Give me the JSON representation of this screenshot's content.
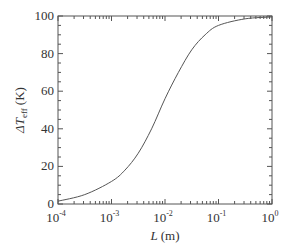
{
  "chart_data": {
    "type": "line",
    "title": "",
    "xlabel": "L (m)",
    "xlabel_var": "L",
    "xlabel_unit": "(m)",
    "ylabel": "ΔT_eff (K)",
    "ylabel_prefix": "ΔT",
    "ylabel_sub": "eff",
    "ylabel_unit": "(K)",
    "xscale": "log",
    "xlim": [
      0.0001,
      1
    ],
    "ylim": [
      0,
      100
    ],
    "grid": false,
    "legend": null,
    "x_ticks": [
      {
        "base": "10",
        "exp": "-4",
        "value": 0.0001
      },
      {
        "base": "10",
        "exp": "-3",
        "value": 0.001
      },
      {
        "base": "10",
        "exp": "-2",
        "value": 0.01
      },
      {
        "base": "10",
        "exp": "-1",
        "value": 0.1
      },
      {
        "base": "10",
        "exp": "0",
        "value": 1
      }
    ],
    "y_ticks": [
      "0",
      "20",
      "40",
      "60",
      "80",
      "100"
    ],
    "series": [
      {
        "name": "ΔT_eff",
        "color": "#555555",
        "x": [
          0.0001,
          0.000316,
          0.001,
          0.00178,
          0.00316,
          0.00562,
          0.01,
          0.0178,
          0.0316,
          0.0562,
          0.1,
          0.316,
          1
        ],
        "y": [
          1.5,
          5,
          12,
          18,
          27,
          40,
          56,
          70,
          82,
          90,
          95,
          98.5,
          99.5
        ]
      }
    ]
  }
}
